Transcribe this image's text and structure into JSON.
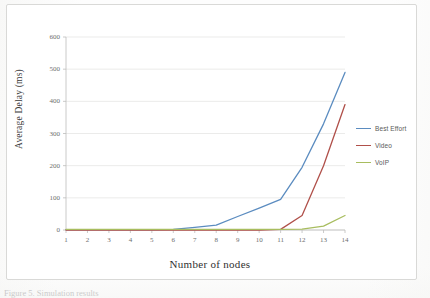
{
  "figure": {
    "caption": "Figure 5. Simulation results",
    "frame_color": "#d9d9d7"
  },
  "chart_data": {
    "type": "line",
    "title": "",
    "xlabel": "Number of nodes",
    "ylabel": "Average Delay (ms)",
    "x": [
      1,
      2,
      3,
      4,
      5,
      6,
      7,
      8,
      9,
      10,
      11,
      12,
      13,
      14
    ],
    "xticks": [
      "1",
      "2",
      "3",
      "4",
      "5",
      "6",
      "7",
      "8",
      "9",
      "10",
      "11",
      "12",
      "13",
      "14"
    ],
    "yticks": [
      "0",
      "100",
      "200",
      "300",
      "400",
      "500",
      "600"
    ],
    "ytick_values": [
      0,
      100,
      200,
      300,
      400,
      500,
      600
    ],
    "xlim": [
      1,
      14
    ],
    "ylim": [
      0,
      600
    ],
    "grid": "horizontal",
    "legend_position": "right",
    "series": [
      {
        "name": "Best Effort",
        "color": "#5b8cc0",
        "values": [
          1,
          1,
          1,
          1,
          1,
          2,
          8,
          15,
          42,
          68,
          95,
          195,
          330,
          490
        ]
      },
      {
        "name": "Video",
        "color": "#b0504a",
        "values": [
          0,
          0,
          0,
          0,
          0,
          0,
          0,
          0,
          0,
          0,
          2,
          45,
          200,
          390
        ]
      },
      {
        "name": "VoIP",
        "color": "#a8bd5f",
        "values": [
          2,
          2,
          2,
          2,
          2,
          2,
          2,
          2,
          2,
          2,
          2,
          3,
          12,
          45
        ]
      }
    ]
  },
  "legend": {
    "items": [
      {
        "label": "Best Effort",
        "color": "#5b8cc0"
      },
      {
        "label": "Video",
        "color": "#b0504a"
      },
      {
        "label": "VoIP",
        "color": "#a8bd5f"
      }
    ]
  }
}
